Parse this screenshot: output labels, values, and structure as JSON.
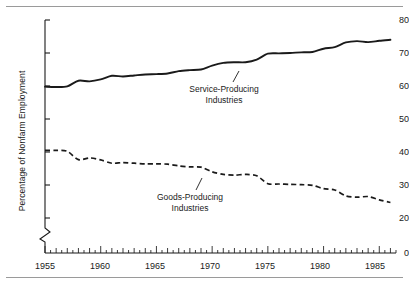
{
  "chart_data": {
    "type": "line",
    "title": "",
    "subtitle": "",
    "xlabel": "",
    "ylabel": "Percentage of Nonfarm Employment",
    "xlim": [
      1955,
      1986.5
    ],
    "ylim": [
      20,
      80
    ],
    "y_axis_break": true,
    "y_break_between": [
      0,
      20
    ],
    "grid": false,
    "legend": "none (inline annotations with leader lines)",
    "yticks": [
      0,
      20,
      30,
      40,
      50,
      60,
      70,
      80
    ],
    "ytick_labels": [
      "0",
      "20",
      "30",
      "40",
      "50",
      "60",
      "70",
      "80"
    ],
    "xticks": [
      1955,
      1960,
      1965,
      1970,
      1975,
      1980,
      1985
    ],
    "xtick_labels": [
      "1955",
      "1960",
      "1965",
      "1970",
      "1975",
      "1980",
      "1985"
    ],
    "x_minor_tick_interval": 0.5,
    "annotations": [
      {
        "name": "service-producing-label",
        "line1": "Service-Producing",
        "line2": "Industries",
        "points_to_series": "Service-Producing Industries"
      },
      {
        "name": "goods-producing-label",
        "line1": "Goods-Producing",
        "line2": "Industries",
        "points_to_series": "Goods-Producing Industries"
      }
    ],
    "x": [
      1955,
      1956,
      1957,
      1958,
      1959,
      1960,
      1961,
      1962,
      1963,
      1964,
      1965,
      1966,
      1967,
      1968,
      1969,
      1970,
      1971,
      1972,
      1973,
      1974,
      1975,
      1976,
      1977,
      1978,
      1979,
      1980,
      1981,
      1982,
      1983,
      1984,
      1985,
      1986
    ],
    "series": [
      {
        "name": "Service-Producing Industries",
        "style": "solid",
        "color": "#1a1a1a",
        "values": [
          59.8,
          59.7,
          59.9,
          61.6,
          61.4,
          62.0,
          63.1,
          62.9,
          63.2,
          63.5,
          63.6,
          63.8,
          64.5,
          64.8,
          65.0,
          66.2,
          67.0,
          67.2,
          67.2,
          68.0,
          69.8,
          69.9,
          70.0,
          70.2,
          70.3,
          71.3,
          71.8,
          73.2,
          73.6,
          73.3,
          73.7,
          74.0
        ]
      },
      {
        "name": "Goods-Producing Industries",
        "style": "dashed",
        "color": "#1a1a1a",
        "values": [
          40.5,
          40.5,
          40.2,
          37.7,
          38.2,
          37.6,
          36.6,
          36.8,
          36.6,
          36.4,
          36.4,
          36.3,
          35.8,
          35.5,
          35.4,
          34.0,
          33.2,
          33.0,
          33.2,
          32.8,
          30.4,
          30.3,
          30.2,
          30.1,
          29.9,
          28.9,
          28.5,
          26.7,
          26.3,
          26.5,
          25.5,
          24.7
        ]
      }
    ]
  },
  "figure": {
    "top_rule": "",
    "bottom_rule": ""
  }
}
